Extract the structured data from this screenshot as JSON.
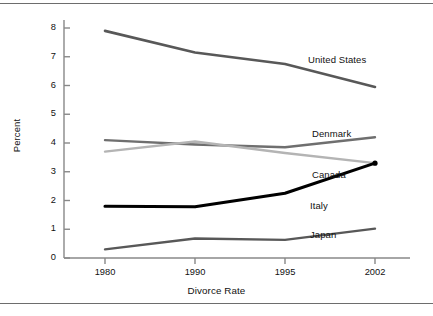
{
  "chart_data": {
    "type": "line",
    "title": "",
    "xlabel": "Divorce Rate",
    "ylabel": "Percent",
    "categories": [
      "1980",
      "1990",
      "1995",
      "2002"
    ],
    "x": [
      1980,
      1990,
      1995,
      2002
    ],
    "xlim": [
      1978,
      2004
    ],
    "ylim": [
      0,
      8.4
    ],
    "yticks": [
      "0",
      "1",
      "2",
      "3",
      "4",
      "5",
      "6",
      "7",
      "8"
    ],
    "ytick_values": [
      0,
      1,
      2,
      3,
      4,
      5,
      6,
      7,
      8
    ],
    "grid": false,
    "legend_position": "inline-right-of-lines",
    "series": [
      {
        "name": "United States",
        "values": [
          7.9,
          7.15,
          6.75,
          5.95
        ],
        "color": "#585858",
        "width": 2.6,
        "label_x": 308,
        "label_y": 54,
        "marker": false
      },
      {
        "name": "Denmark",
        "values": [
          4.1,
          3.95,
          3.85,
          4.2
        ],
        "color": "#6f6f6f",
        "width": 2.4,
        "label_x": 312,
        "label_y": 128,
        "marker": false
      },
      {
        "name": "Canada",
        "values": [
          3.7,
          4.05,
          3.65,
          3.3
        ],
        "color": "#b4b4b4",
        "width": 2.4,
        "label_x": 312,
        "label_y": 169,
        "marker": false
      },
      {
        "name": "Italy",
        "values": [
          1.8,
          1.78,
          2.25,
          3.3
        ],
        "color": "#000000",
        "width": 3.1,
        "label_x": 310,
        "label_y": 200,
        "marker": true
      },
      {
        "name": "Japan",
        "values": [
          0.3,
          0.68,
          0.63,
          1.02
        ],
        "color": "#585858",
        "width": 2.4,
        "label_x": 310,
        "label_y": 229,
        "marker": false
      }
    ],
    "axis_color": "#888888",
    "text_color": "#111111",
    "background": "#ffffff"
  },
  "figure": {
    "rule_color": "#6d6d6d"
  }
}
